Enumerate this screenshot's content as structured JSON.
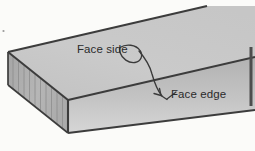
{
  "figure": {
    "kind": "technical-illustration",
    "background_color": "#fbfbf9"
  },
  "labels": {
    "face_side": "Face side",
    "face_edge": "Face edge",
    "text_color": "#2b2b2b"
  },
  "annotations": {
    "leader_face_side_target": "top face of board",
    "leader_face_edge_target": "front long edge of board",
    "leader_color": "#3a3a3a"
  },
  "board": {
    "top_face_color": "#c9c9c9",
    "front_face_color_top": "#b4b4b4",
    "front_face_color_bottom": "#d2d2d2",
    "end_face_color": "#b0b0b0",
    "outline_color": "#3c3c3c",
    "grain_line_color": "#8a8a8a",
    "end_grain_line_count": "11"
  },
  "artifacts": {
    "right_edge_band_color": "#4a4a4a",
    "speck_color": "#9a9a9a"
  }
}
